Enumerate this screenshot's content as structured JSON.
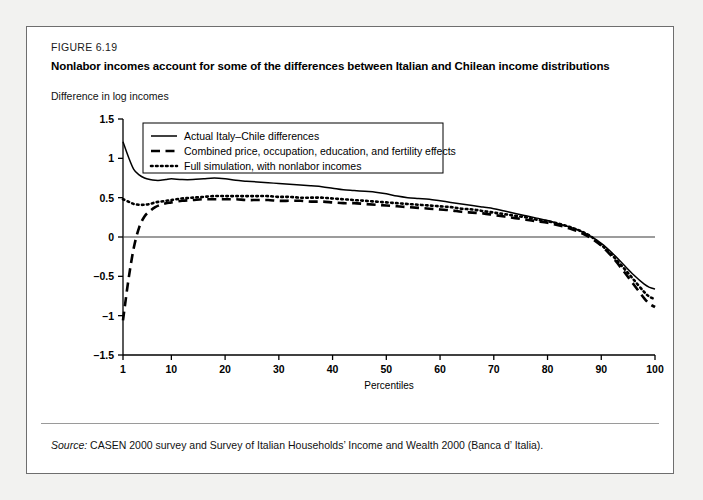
{
  "figure": {
    "label": "FIGURE 6.19",
    "title": "Nonlabor incomes account for some of the differences between Italian and Chilean income distributions",
    "source_prefix": "Source:",
    "source_text": "CASEN 2000 survey and Survey of Italian Households’ Income and Wealth 2000 (Banca d’ Italia)."
  },
  "chart_data": {
    "type": "line",
    "title": "Nonlabor incomes account for some of the differences between Italian and Chilean income distributions",
    "xlabel": "Percentiles",
    "ylabel": "Difference in log incomes",
    "xlim": [
      1,
      100
    ],
    "ylim": [
      -1.5,
      1.5
    ],
    "xticks": [
      1,
      10,
      20,
      30,
      40,
      50,
      60,
      70,
      80,
      90,
      100
    ],
    "xticklabels": [
      "1",
      "10",
      "20",
      "30",
      "40",
      "50",
      "60",
      "70",
      "80",
      "90",
      "100"
    ],
    "yticks": [
      1.5,
      1,
      0.5,
      0,
      -0.5,
      -1,
      -1.5
    ],
    "yticklabels": [
      "1.5",
      "1",
      "0.5",
      "0",
      "-0.5",
      "-1",
      "-1.5"
    ],
    "grid": false,
    "zero_line": true,
    "legend_position": "upper-left",
    "series": [
      {
        "name": "Actual Italy–Chile differences",
        "style": "solid",
        "color": "#000000",
        "x": [
          1,
          2,
          3,
          4,
          5,
          6,
          7,
          8,
          9,
          10,
          12,
          14,
          16,
          18,
          20,
          22,
          24,
          26,
          28,
          30,
          32,
          34,
          36,
          38,
          40,
          42,
          44,
          46,
          48,
          50,
          52,
          54,
          56,
          58,
          60,
          62,
          64,
          66,
          68,
          70,
          72,
          74,
          76,
          78,
          80,
          82,
          84,
          86,
          88,
          90,
          92,
          94,
          96,
          98,
          99,
          100
        ],
        "y": [
          1.21,
          1.02,
          0.86,
          0.79,
          0.75,
          0.73,
          0.72,
          0.72,
          0.73,
          0.74,
          0.73,
          0.73,
          0.74,
          0.75,
          0.74,
          0.72,
          0.71,
          0.7,
          0.69,
          0.68,
          0.67,
          0.66,
          0.65,
          0.64,
          0.62,
          0.6,
          0.59,
          0.58,
          0.57,
          0.55,
          0.52,
          0.5,
          0.49,
          0.48,
          0.46,
          0.44,
          0.42,
          0.4,
          0.38,
          0.36,
          0.33,
          0.3,
          0.27,
          0.24,
          0.21,
          0.17,
          0.13,
          0.08,
          0.01,
          -0.08,
          -0.2,
          -0.34,
          -0.48,
          -0.6,
          -0.64,
          -0.66
        ]
      },
      {
        "name": "Combined price, occupation, education, and fertility effects",
        "style": "dashed",
        "color": "#000000",
        "x": [
          1,
          2,
          3,
          4,
          5,
          6,
          7,
          8,
          9,
          10,
          12,
          14,
          16,
          18,
          20,
          22,
          24,
          26,
          28,
          30,
          32,
          34,
          36,
          38,
          40,
          42,
          44,
          46,
          48,
          50,
          52,
          54,
          56,
          58,
          60,
          62,
          64,
          66,
          68,
          70,
          72,
          74,
          76,
          78,
          80,
          82,
          84,
          86,
          88,
          90,
          92,
          94,
          96,
          98,
          99,
          100
        ],
        "y": [
          -1.06,
          -0.55,
          -0.14,
          0.12,
          0.26,
          0.33,
          0.38,
          0.41,
          0.43,
          0.44,
          0.46,
          0.47,
          0.48,
          0.48,
          0.48,
          0.48,
          0.47,
          0.47,
          0.47,
          0.46,
          0.46,
          0.46,
          0.45,
          0.45,
          0.44,
          0.43,
          0.43,
          0.42,
          0.41,
          0.4,
          0.39,
          0.38,
          0.37,
          0.36,
          0.35,
          0.34,
          0.32,
          0.31,
          0.3,
          0.28,
          0.26,
          0.24,
          0.22,
          0.2,
          0.18,
          0.15,
          0.11,
          0.06,
          -0.01,
          -0.11,
          -0.25,
          -0.42,
          -0.6,
          -0.78,
          -0.85,
          -0.89
        ]
      },
      {
        "name": "Full simulation, with nonlabor incomes",
        "style": "dotted",
        "color": "#000000",
        "x": [
          1,
          2,
          3,
          4,
          5,
          6,
          7,
          8,
          9,
          10,
          12,
          14,
          16,
          18,
          20,
          22,
          24,
          26,
          28,
          30,
          32,
          34,
          36,
          38,
          40,
          42,
          44,
          46,
          48,
          50,
          52,
          54,
          56,
          58,
          60,
          62,
          64,
          66,
          68,
          70,
          72,
          74,
          76,
          78,
          80,
          82,
          84,
          86,
          88,
          90,
          92,
          94,
          96,
          98,
          99,
          100
        ],
        "y": [
          0.48,
          0.45,
          0.42,
          0.41,
          0.41,
          0.42,
          0.44,
          0.45,
          0.46,
          0.47,
          0.49,
          0.5,
          0.51,
          0.52,
          0.52,
          0.52,
          0.52,
          0.52,
          0.52,
          0.51,
          0.51,
          0.5,
          0.5,
          0.5,
          0.49,
          0.48,
          0.47,
          0.46,
          0.45,
          0.44,
          0.43,
          0.42,
          0.41,
          0.4,
          0.39,
          0.38,
          0.36,
          0.35,
          0.33,
          0.31,
          0.29,
          0.27,
          0.25,
          0.22,
          0.2,
          0.17,
          0.13,
          0.08,
          0.01,
          -0.1,
          -0.23,
          -0.38,
          -0.54,
          -0.7,
          -0.76,
          -0.79
        ]
      }
    ]
  }
}
